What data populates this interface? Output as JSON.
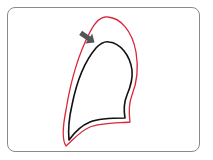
{
  "diagram": {
    "type": "lung-outline-comparison",
    "frame": {
      "border_color": "#8a8a8a",
      "background": "#ffffff"
    },
    "outer_outline": {
      "label": "",
      "color": "#d9263a",
      "meaning": "expanded outline"
    },
    "inner_outline": {
      "label": "",
      "color": "#111111",
      "meaning": "original outline"
    },
    "arrow": {
      "color": "#555555",
      "direction": "down-right"
    }
  }
}
